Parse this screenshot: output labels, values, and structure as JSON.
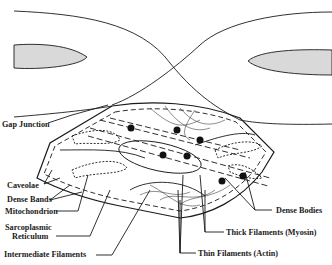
{
  "diagram": {
    "colors": {
      "line": "#1a1a1a",
      "nucleus_fill": "#d9d9d9",
      "background": "#ffffff"
    },
    "labels": {
      "gap_junction": "Gap Junction",
      "caveolae": "Caveolae",
      "dense_bands": "Dense Bands",
      "mitochondrion": "Mitochondrion",
      "sarcoplasmic_1": "Sarcoplasmic",
      "sarcoplasmic_2": "Reticulum",
      "intermediate_filaments": "Intermediate Filaments",
      "dense_bodies": "Dense Bodies",
      "thick_filaments": "Thick Filaments (Myosin)",
      "thin_filaments": "Thin Filaments (Actin)"
    }
  }
}
